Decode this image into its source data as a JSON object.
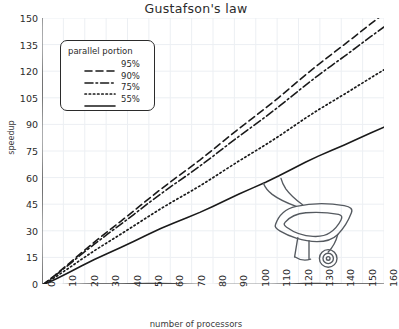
{
  "chart_data": {
    "type": "line",
    "title": "Gustafson's law",
    "xlabel": "number of processors",
    "ylabel": "speedup",
    "xlim": [
      0,
      160
    ],
    "ylim": [
      0,
      150
    ],
    "grid": true,
    "style": "hand-drawn",
    "legend_position": "upper left",
    "legend_title": "parallel portion",
    "xticks": [
      0,
      10,
      20,
      30,
      40,
      50,
      60,
      70,
      80,
      90,
      100,
      110,
      120,
      130,
      140,
      150,
      160
    ],
    "yticks": [
      0,
      15,
      30,
      45,
      60,
      75,
      90,
      105,
      120,
      135,
      150
    ],
    "x": [
      0,
      160
    ],
    "series": [
      {
        "name": "95%",
        "label": "95%",
        "dash": "dashed",
        "color": "#1a1a1a",
        "values": [
          0,
          152.4
        ]
      },
      {
        "name": "90%",
        "label": "90%",
        "dash": "dashdot",
        "color": "#1a1a1a",
        "values": [
          0,
          144.9
        ]
      },
      {
        "name": "75%",
        "label": "75%",
        "dash": "dotted",
        "color": "#1a1a1a",
        "values": [
          0,
          120.75
        ]
      },
      {
        "name": "55%",
        "label": "55%",
        "dash": "solid",
        "color": "#1a1a1a",
        "values": [
          0,
          88.45
        ]
      }
    ],
    "annotations": [
      {
        "name": "wheelbarrow-illustration",
        "x": 120,
        "y": 42
      }
    ]
  },
  "colors": {
    "line": "#1a1a1a",
    "axis": "#4a4a4a",
    "grid": "#eceff3",
    "text": "#2b2b2b",
    "background": "#ffffff"
  }
}
